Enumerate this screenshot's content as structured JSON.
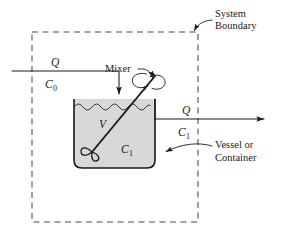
{
  "figure": {
    "background_color": "#ffffff",
    "line_color": "#1a1a1a",
    "boundary_color": "#4a4a4a",
    "liquid_fill_color": "#d8d8d8"
  },
  "labels": {
    "system_boundary_line1": "System",
    "system_boundary_line2": "Boundary",
    "mixer": "Mixer",
    "vessel_line1": "Vessel or",
    "vessel_line2": "Container"
  },
  "symbols": {
    "inlet_flow": "Q",
    "inlet_concentration": "C",
    "inlet_concentration_sub": "0",
    "outlet_flow": "Q",
    "outlet_concentration": "C",
    "outlet_concentration_sub": "1",
    "volume": "V",
    "tank_concentration": "C",
    "tank_concentration_sub": "1"
  },
  "icons": {
    "inlet_arrow": "down-arrow-icon",
    "outlet_arrow": "right-arrow-icon",
    "boundary_pointer": "curved-arrow-icon",
    "mixer_pointer": "curved-arrow-icon",
    "vessel_pointer": "curved-arrow-icon",
    "rotation": "rotation-arrows-icon",
    "impeller": "impeller-icon"
  }
}
